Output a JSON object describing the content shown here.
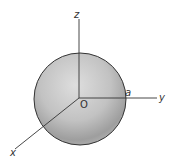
{
  "figure": {
    "type": "sphere-with-axes",
    "sphere": {
      "cx": 80,
      "cy": 99,
      "r": 46,
      "fill_light": "#dcdcdc",
      "fill_dark": "#9a9a9a",
      "stroke": "#333333"
    },
    "origin": {
      "x": 79,
      "y": 98
    },
    "axes": {
      "z": {
        "label": "z",
        "end": {
          "x": 79,
          "y": 19
        }
      },
      "y": {
        "label": "y",
        "end": {
          "x": 157,
          "y": 98
        }
      },
      "x": {
        "label": "x",
        "end": {
          "x": 15,
          "y": 149
        }
      }
    },
    "labels": {
      "origin": "O",
      "radius": "a",
      "z": "z",
      "y": "y",
      "x": "x"
    },
    "axis_color": "#333333"
  }
}
